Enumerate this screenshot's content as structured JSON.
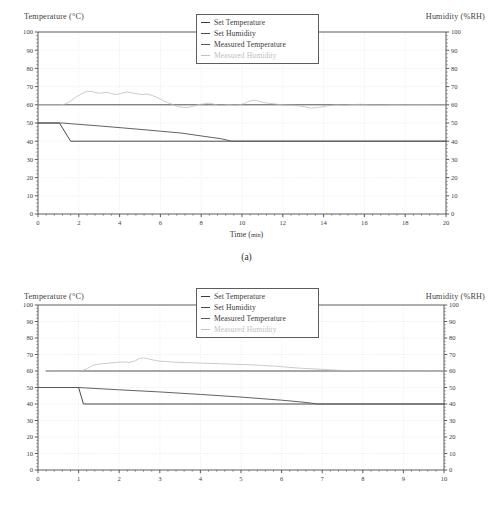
{
  "figures": [
    {
      "id": "a",
      "caption": "(a)",
      "left_axis_title": "Temperature (°C)",
      "right_axis_title": "Humidity (%RH)",
      "x_axis_title_main": "Time (",
      "x_axis_title_unit": "min",
      "x_axis_title_close": ")",
      "legend": [
        {
          "label": "Set Temperature",
          "color": "#3d3d3d"
        },
        {
          "label": "Set Humidity",
          "color": "#4a4a4a"
        },
        {
          "label": "Measured Temperature",
          "color": "#5a5a5a"
        },
        {
          "label": "Measured Humidity",
          "color": "#b9b9b9"
        }
      ],
      "chart_data": {
        "type": "line",
        "title": "",
        "xlabel": "Time (min)",
        "ylabel": "Temperature (°C)",
        "y2label": "Humidity (%RH)",
        "xlim": [
          0,
          20
        ],
        "ylim": [
          0,
          100
        ],
        "y2lim": [
          0,
          100
        ],
        "xticks": [
          0,
          2,
          4,
          6,
          8,
          10,
          12,
          14,
          16,
          18,
          20
        ],
        "yticks": [
          0,
          10,
          20,
          30,
          40,
          50,
          60,
          70,
          80,
          90,
          100
        ],
        "grid": true,
        "legend_position": "top-center",
        "series": [
          {
            "name": "Set Temperature",
            "color": "#3d3d3d",
            "axis": "left",
            "points": [
              [
                0,
                50
              ],
              [
                1.05,
                50
              ],
              [
                1.6,
                40
              ],
              [
                20,
                40
              ]
            ]
          },
          {
            "name": "Set Humidity",
            "color": "#4a4a4a",
            "axis": "right",
            "points": [
              [
                0,
                60
              ],
              [
                20,
                60
              ]
            ]
          },
          {
            "name": "Measured Temperature",
            "color": "#5a5a5a",
            "axis": "left",
            "points": [
              [
                0,
                50
              ],
              [
                1.2,
                50
              ],
              [
                1.6,
                49.6
              ],
              [
                3,
                48.4
              ],
              [
                5,
                46.5
              ],
              [
                7,
                44.5
              ],
              [
                9,
                41.3
              ],
              [
                9.5,
                40
              ],
              [
                20,
                40
              ]
            ]
          },
          {
            "name": "Measured Humidity",
            "color": "#b9b9b9",
            "axis": "right",
            "points": [
              [
                0,
                60
              ],
              [
                1.05,
                60
              ],
              [
                1.3,
                60.3
              ],
              [
                1.6,
                62.0
              ],
              [
                1.85,
                64.2
              ],
              [
                2.1,
                65.8
              ],
              [
                2.35,
                67.2
              ],
              [
                2.6,
                67.4
              ],
              [
                2.85,
                66.6
              ],
              [
                3.1,
                66.4
              ],
              [
                3.35,
                66.9
              ],
              [
                3.6,
                66.2
              ],
              [
                3.85,
                65.6
              ],
              [
                4.1,
                66.4
              ],
              [
                4.35,
                67.0
              ],
              [
                4.6,
                66.6
              ],
              [
                4.85,
                66.0
              ],
              [
                5.1,
                65.6
              ],
              [
                5.35,
                65.9
              ],
              [
                5.6,
                65.1
              ],
              [
                5.85,
                64.0
              ],
              [
                6.1,
                62.5
              ],
              [
                6.35,
                61.2
              ],
              [
                6.6,
                60.2
              ],
              [
                6.85,
                59.1
              ],
              [
                7.1,
                58.6
              ],
              [
                7.35,
                58.5
              ],
              [
                7.6,
                59.2
              ],
              [
                7.85,
                60.1
              ],
              [
                8.1,
                60.4
              ],
              [
                8.35,
                60.9
              ],
              [
                8.6,
                60.4
              ],
              [
                8.85,
                59.7
              ],
              [
                9.1,
                59.8
              ],
              [
                9.35,
                60.2
              ],
              [
                9.6,
                59.8
              ],
              [
                9.85,
                60.0
              ],
              [
                10.1,
                60.6
              ],
              [
                10.35,
                62.0
              ],
              [
                10.6,
                62.6
              ],
              [
                10.85,
                61.9
              ],
              [
                11.1,
                61.2
              ],
              [
                11.35,
                60.8
              ],
              [
                11.6,
                60.5
              ],
              [
                11.85,
                60.1
              ],
              [
                12.1,
                59.9
              ],
              [
                12.6,
                59.7
              ],
              [
                13.0,
                59.0
              ],
              [
                13.4,
                58.2
              ],
              [
                13.8,
                58.6
              ],
              [
                14.2,
                59.4
              ],
              [
                14.6,
                60.0
              ],
              [
                15.0,
                59.8
              ],
              [
                15.4,
                60.1
              ],
              [
                15.8,
                60.3
              ],
              [
                16.2,
                60.0
              ],
              [
                16.8,
                59.9
              ],
              [
                17.4,
                60.1
              ],
              [
                18.0,
                60.0
              ],
              [
                18.8,
                60.1
              ],
              [
                19.4,
                60.0
              ],
              [
                20,
                60.0
              ]
            ]
          }
        ]
      }
    },
    {
      "id": "b",
      "caption": "",
      "left_axis_title": "Temperature (°C)",
      "right_axis_title": "Humidity (%RH)",
      "x_axis_title_main": "",
      "x_axis_title_unit": "",
      "x_axis_title_close": "",
      "legend": [
        {
          "label": "Set Temperature",
          "color": "#3d3d3d"
        },
        {
          "label": "Set Humidity",
          "color": "#4a4a4a"
        },
        {
          "label": "Measured Temperature",
          "color": "#5a5a5a"
        },
        {
          "label": "Measured Humidity",
          "color": "#b9b9b9"
        }
      ],
      "chart_data": {
        "type": "line",
        "title": "",
        "xlabel": "",
        "ylabel": "Temperature (°C)",
        "y2label": "Humidity (%RH)",
        "xlim": [
          0,
          10
        ],
        "ylim": [
          0,
          100
        ],
        "y2lim": [
          0,
          100
        ],
        "xticks": [
          0,
          1,
          2,
          3,
          4,
          5,
          6,
          7,
          8,
          9,
          10
        ],
        "yticks": [
          0,
          10,
          20,
          30,
          40,
          50,
          60,
          70,
          80,
          90,
          100
        ],
        "grid": true,
        "legend_position": "top-center",
        "series": [
          {
            "name": "Set Temperature",
            "color": "#3d3d3d",
            "axis": "left",
            "points": [
              [
                0,
                50
              ],
              [
                1.0,
                50
              ],
              [
                1.12,
                40
              ],
              [
                10,
                40
              ]
            ]
          },
          {
            "name": "Set Humidity",
            "color": "#4a4a4a",
            "axis": "right",
            "points": [
              [
                0.2,
                60
              ],
              [
                10,
                60
              ]
            ]
          },
          {
            "name": "Measured Temperature",
            "color": "#5a5a5a",
            "axis": "left",
            "points": [
              [
                0,
                50
              ],
              [
                1.0,
                50
              ],
              [
                1.2,
                49.7
              ],
              [
                2,
                48.6
              ],
              [
                3,
                47.3
              ],
              [
                4,
                45.8
              ],
              [
                5,
                44.2
              ],
              [
                6,
                42.3
              ],
              [
                6.5,
                41.2
              ],
              [
                6.9,
                40
              ],
              [
                10,
                40
              ]
            ]
          },
          {
            "name": "Measured Humidity",
            "color": "#b9b9b9",
            "axis": "right",
            "points": [
              [
                0.2,
                60
              ],
              [
                1.05,
                60
              ],
              [
                1.2,
                61.3
              ],
              [
                1.35,
                63.4
              ],
              [
                1.5,
                64.2
              ],
              [
                1.65,
                64.5
              ],
              [
                1.8,
                64.9
              ],
              [
                1.95,
                65.2
              ],
              [
                2.1,
                65.5
              ],
              [
                2.25,
                65.2
              ],
              [
                2.4,
                66.2
              ],
              [
                2.5,
                67.6
              ],
              [
                2.6,
                67.9
              ],
              [
                2.7,
                67.5
              ],
              [
                2.85,
                66.6
              ],
              [
                3.0,
                66.0
              ],
              [
                3.2,
                65.6
              ],
              [
                3.4,
                65.3
              ],
              [
                3.6,
                65.1
              ],
              [
                3.8,
                65.0
              ],
              [
                4.0,
                64.8
              ],
              [
                4.3,
                64.6
              ],
              [
                4.6,
                64.3
              ],
              [
                4.9,
                64.0
              ],
              [
                5.2,
                63.8
              ],
              [
                5.5,
                63.4
              ],
              [
                5.8,
                63.0
              ],
              [
                6.1,
                62.4
              ],
              [
                6.4,
                61.8
              ],
              [
                6.7,
                61.4
              ],
              [
                7.0,
                61.0
              ],
              [
                7.3,
                60.6
              ],
              [
                7.6,
                60.2
              ],
              [
                7.9,
                60.0
              ],
              [
                8.2,
                59.9
              ],
              [
                8.6,
                59.9
              ],
              [
                9.0,
                60.0
              ],
              [
                9.5,
                60.0
              ],
              [
                10,
                60.0
              ]
            ]
          }
        ]
      }
    }
  ]
}
